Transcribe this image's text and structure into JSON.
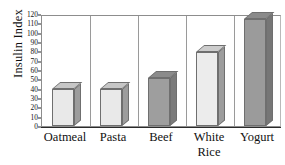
{
  "chart_data": {
    "type": "bar",
    "title": "",
    "subtitle": "",
    "xlabel": "",
    "ylabel": "Insulin Index",
    "categories": [
      "Oatmeal",
      "Pasta",
      "Beef",
      "White Rice",
      "Yogurt"
    ],
    "category_labels_display": [
      "Oatmeal",
      "Pasta",
      "Beef",
      "White\nRice",
      "Yogurt"
    ],
    "values": [
      40,
      40,
      51,
      79,
      115
    ],
    "ylim": [
      0,
      120
    ],
    "ytick_values": [
      0,
      10,
      20,
      30,
      40,
      50,
      60,
      70,
      80,
      90,
      100,
      110,
      120
    ],
    "ytick_labels": [
      "0",
      "10",
      "20",
      "30",
      "40",
      "50",
      "60",
      "70",
      "80",
      "90",
      "100",
      "110",
      "120"
    ],
    "ytick_interval": 10,
    "grid": "vertical-category-separators",
    "legend": "none",
    "style": "3d-columns",
    "bar_fill_colors": [
      "#e9e9e9",
      "#e9e9e9",
      "#9e9e9e",
      "#ececec",
      "#9b9b9b"
    ],
    "bar_side_colors": [
      "#9d9d9d",
      "#9d9d9d",
      "#7b7b7b",
      "#9d9d9d",
      "#767676"
    ],
    "bar_top_colors": [
      "#c6c6c6",
      "#c6c6c6",
      "#8b8b8b",
      "#cccccc",
      "#8a8a8a"
    ],
    "annotations": []
  },
  "colors": {
    "background": "#ffffff",
    "axis": "#2b2b2b",
    "frame": "#8d8d8d",
    "separator": "#9a9a9a",
    "text": "#111111"
  }
}
